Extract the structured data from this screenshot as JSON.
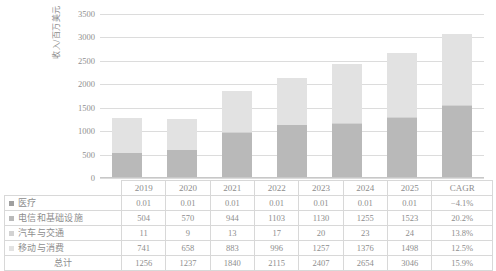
{
  "chart_data": {
    "type": "bar",
    "subtype": "stacked-bar",
    "title": "",
    "xlabel": "",
    "ylabel": "收入/百万美元",
    "ylim": [
      0,
      3500
    ],
    "ytick_values": [
      0,
      500,
      1000,
      1500,
      2000,
      2500,
      3000,
      3500
    ],
    "ytick_labels": [
      "0",
      "500",
      "1000",
      "1500",
      "2000",
      "2500",
      "3000",
      "3500"
    ],
    "grid": true,
    "legend_position": "table-left",
    "categories": [
      "2019",
      "2020",
      "2021",
      "2022",
      "2023",
      "2024",
      "2025"
    ],
    "series": [
      {
        "name": "医疗",
        "color": "#9f9f9f",
        "values": [
          0.01,
          0.01,
          0.01,
          0.01,
          0.01,
          0.01,
          0.01
        ],
        "display_values": [
          "0.01",
          "0.01",
          "0.01",
          "0.01",
          "0.01",
          "0.01",
          "0.01"
        ],
        "cagr": "−4.1%"
      },
      {
        "name": "电信和基础设施",
        "color": "#b9b9b9",
        "values": [
          504,
          570,
          944,
          1103,
          1130,
          1255,
          1523
        ],
        "display_values": [
          "504",
          "570",
          "944",
          "1103",
          "1130",
          "1255",
          "1523"
        ],
        "cagr": "20.2%"
      },
      {
        "name": "汽车与交通",
        "color": "#d2d2d2",
        "values": [
          11,
          9,
          13,
          17,
          20,
          23,
          24
        ],
        "display_values": [
          "11",
          "9",
          "13",
          "17",
          "20",
          "23",
          "24"
        ],
        "cagr": "13.8%"
      },
      {
        "name": "移动与消费",
        "color": "#e2e2e2",
        "values": [
          741,
          658,
          883,
          996,
          1257,
          1376,
          1498
        ],
        "display_values": [
          "741",
          "658",
          "883",
          "996",
          "1257",
          "1376",
          "1498"
        ],
        "cagr": "12.5%"
      }
    ],
    "totals": {
      "name": "总计",
      "values": [
        1256,
        1237,
        1840,
        2115,
        2407,
        2654,
        3046
      ],
      "display_values": [
        "1256",
        "1237",
        "1840",
        "2115",
        "2407",
        "2654",
        "3046"
      ],
      "cagr": "15.9%"
    }
  },
  "table": {
    "corner_label": "",
    "cagr_header": "CAGR",
    "year_headers": [
      "2019",
      "2020",
      "2021",
      "2022",
      "2023",
      "2024",
      "2025"
    ]
  },
  "colors": {
    "gridline": "#dcdcdc",
    "axis": "#c8c8c8",
    "text": "#8d8d8d",
    "border": "#d8d8d8"
  }
}
